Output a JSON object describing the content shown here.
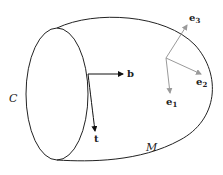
{
  "labels": {
    "curve": "C",
    "manifold": "M",
    "b": "b",
    "t": "t",
    "e1": "e",
    "e1_sub": "1",
    "e2": "e",
    "e2_sub": "2",
    "e3": "e",
    "e3_sub": "3"
  },
  "colors": {
    "outline": "#222222",
    "frame_arrows": "#9a9a9a",
    "tangent_arrows": "#111111"
  }
}
